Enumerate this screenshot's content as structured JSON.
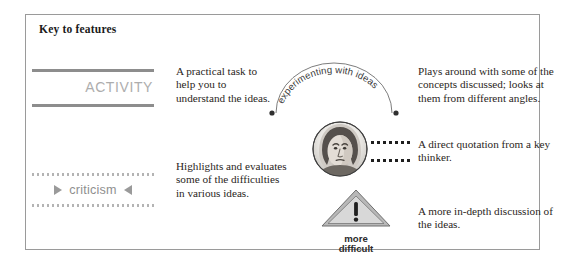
{
  "panel": {
    "title": "Key to features",
    "border_color": "#9a9a9a",
    "background": "#ffffff"
  },
  "features": [
    {
      "id": "activity",
      "badge_label": "ACTIVITY",
      "badge_color": "#adadad",
      "rule_color": "#8d8d8d",
      "description": "A practical task to help you to understand the ideas."
    },
    {
      "id": "criticism",
      "badge_label": "criticism",
      "badge_color": "#8f8f8f",
      "arrow_right": "▶",
      "arrow_left": "◀",
      "dot_color": "#b4b4b4",
      "description": "Highlights and evaluates some of the difficulties in various ideas."
    },
    {
      "id": "experimenting",
      "arc_label": "experimenting with ideas",
      "description": "Plays around with some of the concepts discussed; looks at them from different angles."
    },
    {
      "id": "quotation",
      "icon": "portrait-medallion-icon",
      "description": "A direct quotation from a key thinker."
    },
    {
      "id": "more-difficult",
      "icon": "warning-triangle-icon",
      "badge_label_line1": "more",
      "badge_label_line2": "difficult",
      "description": "A more in-depth discussion of the ideas."
    }
  ]
}
